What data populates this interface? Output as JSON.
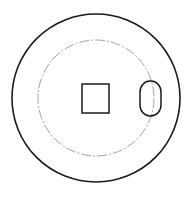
{
  "diagram": {
    "type": "technical-drawing",
    "background": "#ffffff",
    "stroke_color": "#1a1a1a",
    "centerline_color": "#8a8a8a",
    "outer_circle": {
      "cx": 96,
      "cy": 98,
      "r": 84
    },
    "pitch_circle": {
      "cx": 96,
      "cy": 98,
      "r": 58,
      "style": "dash-dot"
    },
    "center_square": {
      "x": 82,
      "y": 84,
      "width": 27,
      "height": 29
    },
    "slot": {
      "cx": 149,
      "cy": 98,
      "rx": 10,
      "ry": 17
    }
  }
}
